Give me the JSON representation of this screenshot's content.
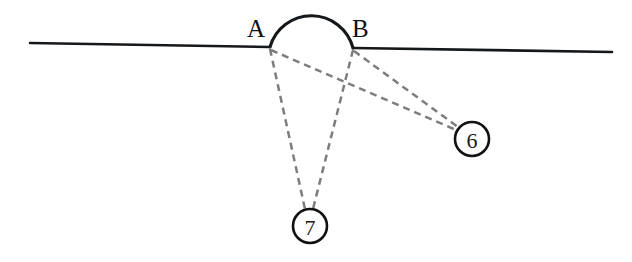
{
  "figure": {
    "background_color": "#ffffff",
    "width": 632,
    "height": 262
  },
  "colors": {
    "stroke_dark": "#15181b",
    "ray_gray": "#7d7d7d",
    "node_stroke": "#111111",
    "label_text": "#111111",
    "node_fill": "#ffffff"
  },
  "surface": {
    "name": "baseline",
    "x1": 30,
    "y1": 43,
    "x2": 612,
    "y2": 52,
    "left_segment": {
      "x1": 30,
      "y1": 43,
      "x2": 270,
      "y2": 47
    },
    "right_segment": {
      "x1": 353,
      "y1": 48,
      "x2": 612,
      "y2": 52
    }
  },
  "arc": {
    "name": "semicircular-bump",
    "start_x": 270,
    "start_y": 47,
    "end_x": 353,
    "end_y": 48,
    "radius": 43,
    "apex_x": 312,
    "apex_y": 6,
    "path": "M 270 47 A 43 43 0 0 1 353 48"
  },
  "vertices": [
    {
      "id": "A",
      "label": "A",
      "x": 270,
      "y": 47,
      "label_x": 247,
      "label_y": 37
    },
    {
      "id": "B",
      "label": "B",
      "x": 353,
      "y": 48,
      "label_x": 352,
      "label_y": 37
    }
  ],
  "nodes": [
    {
      "id": "node-7",
      "label": "7",
      "cx": 310,
      "cy": 226,
      "r": 17
    },
    {
      "id": "node-6",
      "label": "6",
      "cx": 472,
      "cy": 139,
      "r": 17
    }
  ],
  "rays": [
    {
      "id": "ray-a-7",
      "from": "A",
      "to": "7",
      "x1": 270,
      "y1": 49,
      "x2": 305,
      "y2": 209
    },
    {
      "id": "ray-b-7",
      "from": "B",
      "to": "7",
      "x1": 353,
      "y1": 50,
      "x2": 313,
      "y2": 209
    },
    {
      "id": "ray-a-6",
      "from": "A",
      "to": "6",
      "x1": 271,
      "y1": 50,
      "x2": 456,
      "y2": 130
    },
    {
      "id": "ray-b-6",
      "from": "B",
      "to": "6",
      "x1": 354,
      "y1": 51,
      "x2": 458,
      "y2": 127
    }
  ]
}
